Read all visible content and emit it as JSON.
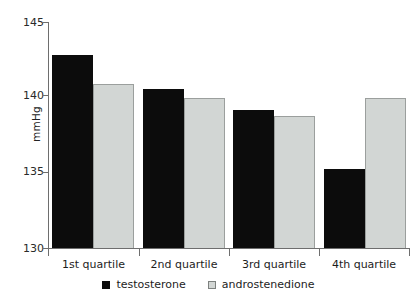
{
  "chart_data": {
    "type": "bar",
    "title": "",
    "subtitle": "",
    "xlabel": "",
    "ylabel": "mmHg",
    "ylim": [
      130,
      145
    ],
    "yticks": [
      130,
      135,
      140,
      145
    ],
    "ytick_labels": [
      "130",
      "135",
      "140",
      "145"
    ],
    "grid": false,
    "legend_position": "bottom-center",
    "categories": [
      "1st quartile",
      "2nd quartile",
      "3rd quartile",
      "4th quartile"
    ],
    "series": [
      {
        "name": "testosterone",
        "color": "#0c0c0c",
        "values": [
          142.8,
          140.6,
          139.2,
          135.3
        ]
      },
      {
        "name": "androstenedione",
        "color": "#d2d6d4",
        "values": [
          140.9,
          140.0,
          138.8,
          140.0
        ]
      }
    ]
  },
  "axes": {
    "y_title": "mmHg",
    "y_tick_0": "130",
    "y_tick_1": "135",
    "y_tick_2": "140",
    "y_tick_3": "145"
  },
  "categories_text": {
    "c0": "1st quartile",
    "c1": "2nd quartile",
    "c2": "3rd quartile",
    "c3": "4th quartile"
  },
  "legend": {
    "item_0_label": "testosterone",
    "item_1_label": "androstenedione"
  }
}
